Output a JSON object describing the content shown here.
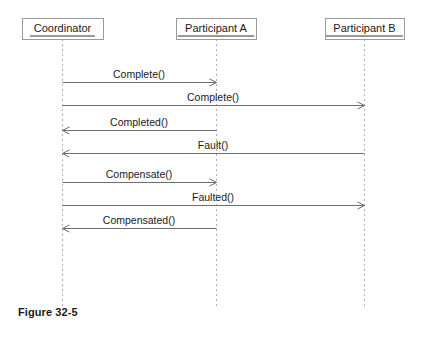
{
  "figure": {
    "caption": "Figure 32-5",
    "caption_x": 18,
    "caption_y": 306
  },
  "colors": {
    "background": "#ffffff",
    "box_border": "#9a9a9a",
    "lifeline": "#b0b0b0",
    "arrow": "#6e6e6e",
    "text": "#1a1a1a"
  },
  "diagram": {
    "type": "sequence",
    "lifelines": [
      {
        "id": "coordinator",
        "label": "Coordinator",
        "x": 62,
        "box_left": 22,
        "box_top": 18,
        "box_width": 81,
        "box_height": 21,
        "line_top": 39,
        "line_bottom": 308
      },
      {
        "id": "participant-a",
        "label": "Participant A",
        "x": 216,
        "box_left": 176,
        "box_top": 18,
        "box_width": 80,
        "box_height": 21,
        "line_top": 39,
        "line_bottom": 308
      },
      {
        "id": "participant-b",
        "label": "Participant B",
        "x": 364,
        "box_left": 325,
        "box_top": 18,
        "box_width": 79,
        "box_height": 21,
        "line_top": 39,
        "line_bottom": 308
      }
    ],
    "messages": [
      {
        "index": 1,
        "label": "Complete()",
        "from": "coordinator",
        "to": "participant-a",
        "from_x": 62,
        "to_x": 216,
        "y": 82,
        "direction": "right",
        "arrowhead": "open"
      },
      {
        "index": 2,
        "label": "Complete()",
        "from": "coordinator",
        "to": "participant-b",
        "from_x": 62,
        "to_x": 364,
        "y": 105,
        "direction": "right",
        "arrowhead": "open"
      },
      {
        "index": 3,
        "label": "Completed()",
        "from": "participant-a",
        "to": "coordinator",
        "from_x": 216,
        "to_x": 62,
        "y": 130,
        "direction": "left",
        "arrowhead": "open"
      },
      {
        "index": 4,
        "label": "Fault()",
        "from": "participant-b",
        "to": "coordinator",
        "from_x": 364,
        "to_x": 62,
        "y": 153,
        "direction": "left",
        "arrowhead": "open"
      },
      {
        "index": 5,
        "label": "Compensate()",
        "from": "coordinator",
        "to": "participant-a",
        "from_x": 62,
        "to_x": 216,
        "y": 182,
        "direction": "right",
        "arrowhead": "open"
      },
      {
        "index": 6,
        "label": "Faulted()",
        "from": "coordinator",
        "to": "participant-b",
        "from_x": 62,
        "to_x": 364,
        "y": 205,
        "direction": "right",
        "arrowhead": "open"
      },
      {
        "index": 7,
        "label": "Compensated()",
        "from": "participant-a",
        "to": "coordinator",
        "from_x": 216,
        "to_x": 62,
        "y": 228,
        "direction": "left",
        "arrowhead": "open"
      }
    ]
  }
}
